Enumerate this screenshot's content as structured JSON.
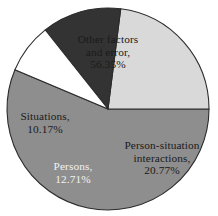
{
  "chart_data": {
    "type": "pie",
    "title": "",
    "subtitle": "",
    "xlabel": "",
    "ylabel": "",
    "legend_position": "none",
    "grid": false,
    "labels_inside_slices": true,
    "units": "percent",
    "categories": [
      "Other factors and error",
      "Person-situation interactions",
      "Persons",
      "Situations"
    ],
    "values": [
      56.35,
      20.77,
      12.71,
      10.17
    ],
    "colors": [
      "#8e8e8e",
      "#d9d9d9",
      "#333333",
      "#ffffff"
    ],
    "slices": [
      {
        "name": "Other factors and error",
        "value": 56.35,
        "value_text": "56.35%",
        "label_line1": "Other factors",
        "label_line2": "and error,",
        "label_text": "Other factors\nand error,\n56.35%",
        "color": "#8e8e8e",
        "text_color": "#1a1a1a",
        "start_angle_deg": 0,
        "end_angle_deg": 202.86
      },
      {
        "name": "Person-situation interactions",
        "value": 20.77,
        "value_text": "20.77%",
        "label_line1": "Person-situation",
        "label_line2": "interactions,",
        "label_text": "Person-situation\ninteractions,\n20.77%",
        "color": "#d9d9d9",
        "text_color": "#1a1a1a",
        "start_angle_deg": 277.23,
        "end_angle_deg": 360
      },
      {
        "name": "Persons",
        "value": 12.71,
        "value_text": "12.71%",
        "label_line1": "Persons,",
        "label_line2": "",
        "label_text": "Persons,\n12.71%",
        "color": "#333333",
        "text_color": "#f2f2f2",
        "start_angle_deg": 231.61,
        "end_angle_deg": 277.23
      },
      {
        "name": "Situations",
        "value": 10.17,
        "value_text": "10.17%",
        "label_line1": "Situations,",
        "label_line2": "",
        "label_text": "Situations,\n10.17%",
        "color": "#ffffff",
        "text_color": "#1a1a1a",
        "start_angle_deg": 202.86,
        "end_angle_deg": 231.61
      }
    ],
    "geometry": {
      "center_x": 108,
      "center_y": 109,
      "radius": 101,
      "outline_color": "#2b2b2b",
      "outline_width": 1.1
    },
    "background_color": "#ffffff"
  }
}
